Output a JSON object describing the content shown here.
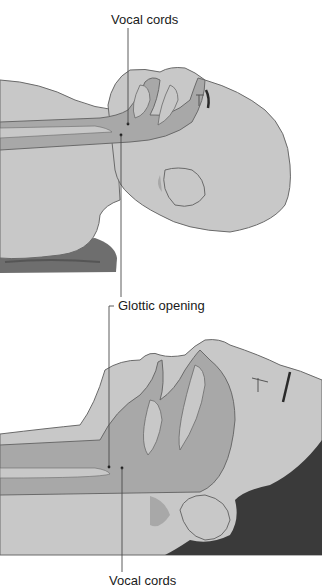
{
  "figure": {
    "panels": [
      {
        "id": "top",
        "description": "Head in neutral position on pillow, airway axes misaligned"
      },
      {
        "id": "bottom",
        "description": "Head extended (sniffing position), airway axes aligned"
      }
    ],
    "labels": {
      "top": "Vocal cords",
      "middle": "Glottic opening",
      "bottom": "Vocal cords"
    },
    "colors": {
      "skin": "#c8c8c8",
      "airway": "#a8a8a8",
      "outline": "#6a6a6a",
      "hair": "#3a3a3a",
      "pillow": "#6e6e6e",
      "leader_line": "#4a4a4a"
    }
  }
}
